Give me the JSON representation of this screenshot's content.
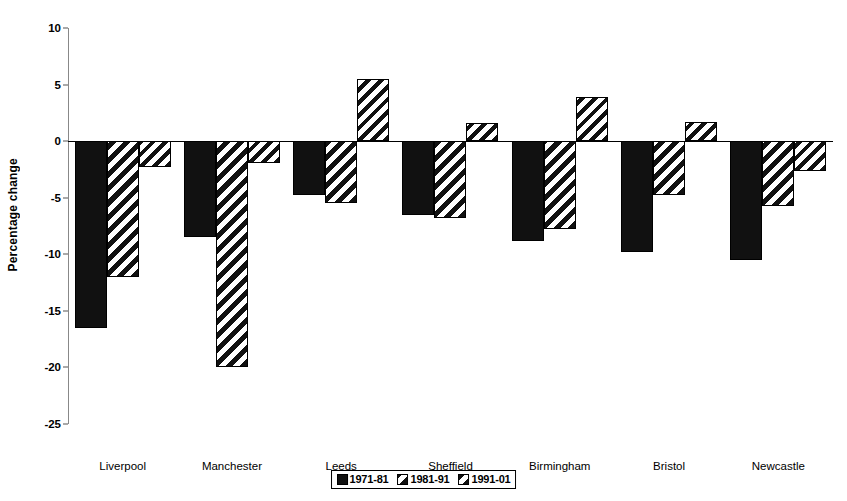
{
  "chart_data": {
    "type": "bar",
    "title": "",
    "xlabel": "",
    "ylabel": "Percentage change",
    "ylim": [
      -25,
      10
    ],
    "ytick_values": [
      10,
      5,
      0,
      -5,
      -10,
      -15,
      -20,
      -25
    ],
    "ytick_labels": [
      "10",
      "5",
      "0",
      "-5",
      "-10",
      "-15",
      "-20",
      "-25"
    ],
    "grid": false,
    "legend_position": "bottom-center",
    "categories": [
      "Liverpool",
      "Manchester",
      "Leeds",
      "Sheffield",
      "Birmingham",
      "Bristol",
      "Newcastle"
    ],
    "series": [
      {
        "name": "1971-81",
        "fill": "solid",
        "values": [
          -16.5,
          -8.5,
          -4.8,
          -6.5,
          -8.8,
          -9.8,
          -10.5
        ]
      },
      {
        "name": "1981-91",
        "fill": "dense-hatch",
        "values": [
          -12.0,
          -20.0,
          -5.5,
          -6.8,
          -7.8,
          -4.8,
          -5.7
        ]
      },
      {
        "name": "1991-01",
        "fill": "sparse-hatch",
        "values": [
          -2.3,
          -1.9,
          5.5,
          1.6,
          3.9,
          1.7,
          -2.6
        ]
      }
    ]
  },
  "legend": {
    "items": [
      {
        "label": "1971-81",
        "fill": "solid"
      },
      {
        "label": "1981-91",
        "fill": "dense-hatch"
      },
      {
        "label": "1991-01",
        "fill": "sparse-hatch"
      }
    ]
  },
  "colors": {
    "bar_ink": "#111111",
    "bar_background": "#ffffff",
    "axis": "#000000",
    "tick": "#555555",
    "page_background": "#ffffff"
  }
}
